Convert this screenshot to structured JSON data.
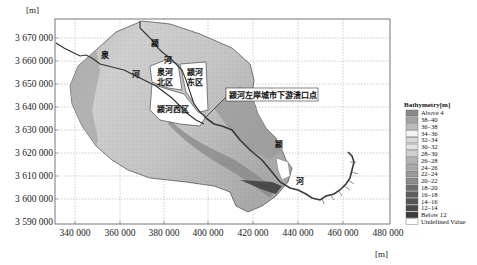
{
  "chart_data": {
    "type": "map",
    "title": "",
    "xlabel": "[m]",
    "ylabel": "[m]",
    "x_ticks": [
      "340 000",
      "360 000",
      "380 000",
      "400 000",
      "420 000",
      "440 000",
      "460 000",
      "480 000"
    ],
    "y_ticks": [
      "3 670 000",
      "3 660 000",
      "3 650 000",
      "3 640 000",
      "3 630 000",
      "3 620 000",
      "3 610 000",
      "3 600 000",
      "3 590 000"
    ],
    "xlim": [
      335000,
      480000
    ],
    "ylim": [
      3590000,
      3678000
    ],
    "grid": true,
    "legend": {
      "title": "Bathymetry[m]",
      "position": "right",
      "entries": [
        {
          "label": "Above 4",
          "color": "#8a8a8a"
        },
        {
          "label": "38–40",
          "color": "#a4a4a4"
        },
        {
          "label": "36–38",
          "color": "#bcbcbc"
        },
        {
          "label": "34–36",
          "color": "#f4f4f4"
        },
        {
          "label": "32–34",
          "color": "#d6d6d6"
        },
        {
          "label": "30–32",
          "color": "#e2e2e2"
        },
        {
          "label": "28–30",
          "color": "#cfcfcf"
        },
        {
          "label": "26–28",
          "color": "#b4b4b4"
        },
        {
          "label": "24–26",
          "color": "#a8a8a8"
        },
        {
          "label": "22–24",
          "color": "#9a9a9a"
        },
        {
          "label": "20–22",
          "color": "#8c8c8c"
        },
        {
          "label": "18–20",
          "color": "#6e6e6e"
        },
        {
          "label": "16–18",
          "color": "#5e5e5e"
        },
        {
          "label": "14–16",
          "color": "#545454"
        },
        {
          "label": "12–14",
          "color": "#4a4a4a"
        },
        {
          "label": "Below 12",
          "color": "#3c3c3c"
        },
        {
          "label": "Undefined Value",
          "color": "#ffffff"
        }
      ]
    },
    "annotations": [
      {
        "text": "颍河左岸城市下游溃口点",
        "type": "callout"
      },
      {
        "text": "泉河北区",
        "type": "region"
      },
      {
        "text": "颍河东区",
        "type": "region"
      },
      {
        "text": "颍河西区",
        "type": "region"
      }
    ],
    "river_labels": [
      "泉",
      "河",
      "颍",
      "河",
      "颍",
      "河"
    ]
  },
  "axis": {
    "y_unit": "[m]",
    "x_unit": "[m]"
  },
  "labels": {
    "quan": "泉",
    "he": "河",
    "ying": "颍",
    "region_quanhe_north_1": "泉河",
    "region_quanhe_north_2": "北区",
    "region_yinghe_east_1": "颍河",
    "region_yinghe_east_2": "东区",
    "region_yinghe_west": "颍河西区",
    "callout": "颍河左岸城市下游溃口点"
  }
}
